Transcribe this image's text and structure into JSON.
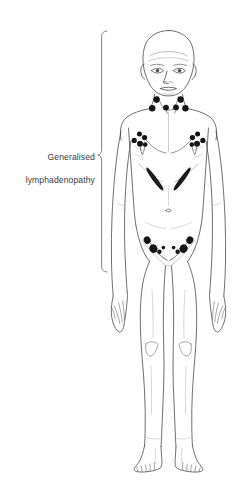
{
  "figure": {
    "type": "medical-anatomical-diagram",
    "background_color": "#ffffff",
    "line_color": "#4a4a4a",
    "marker_color": "#1a1a1a",
    "width": 245,
    "height": 490
  },
  "annotations": [
    {
      "id": "generalised-lymphadenopathy",
      "label_line_1": "Generalised",
      "label_line_2": "lymphadenopathy",
      "label_full": "Generalised lymphadenopathy",
      "bracket": {
        "x": 105,
        "top": 31,
        "bottom": 272,
        "pointer_y": 155
      },
      "text_color": "#3a3a3a",
      "font_size_px": 8.6
    }
  ],
  "node_groups": [
    {
      "name": "cervical-supraclavicular-nodes",
      "region": "neck",
      "count": 6,
      "color": "#141414"
    },
    {
      "name": "left-axillary-nodes",
      "region": "left axilla",
      "count": 5,
      "color": "#141414"
    },
    {
      "name": "right-axillary-nodes",
      "region": "right axilla",
      "count": 5,
      "color": "#141414"
    },
    {
      "name": "hepatosplenic-shading",
      "region": "upper abdomen",
      "count": 2,
      "color": "#1a1a1a"
    },
    {
      "name": "left-inguinal-nodes",
      "region": "left groin",
      "count": 4,
      "color": "#141414"
    },
    {
      "name": "right-inguinal-nodes",
      "region": "right groin",
      "count": 4,
      "color": "#141414"
    }
  ]
}
